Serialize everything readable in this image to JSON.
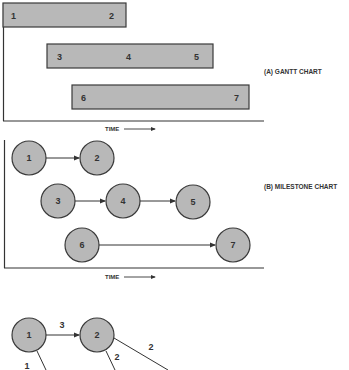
{
  "gantt": {
    "title": "(A) GANTT CHART",
    "time_label": "TIME",
    "bars": [
      {
        "x": 3,
        "y": 3,
        "w": 123,
        "h": 24,
        "labels": [
          {
            "text": "1",
            "x": 12
          },
          {
            "text": "2",
            "x": 112
          }
        ]
      },
      {
        "x": 47,
        "y": 44,
        "w": 166,
        "h": 24,
        "labels": [
          {
            "text": "3",
            "x": 59
          },
          {
            "text": "4",
            "x": 129
          },
          {
            "text": "5",
            "x": 197
          }
        ]
      },
      {
        "x": 72,
        "y": 85,
        "w": 177,
        "h": 24,
        "labels": [
          {
            "text": "6",
            "x": 83
          },
          {
            "text": "7",
            "x": 237
          }
        ]
      }
    ]
  },
  "milestone": {
    "title": "(B) MILESTONE CHART",
    "time_label": "TIME",
    "nodes": [
      {
        "id": "1",
        "cx": 29,
        "cy": 158
      },
      {
        "id": "2",
        "cx": 97,
        "cy": 158
      },
      {
        "id": "3",
        "cx": 58,
        "cy": 201
      },
      {
        "id": "4",
        "cx": 123,
        "cy": 201
      },
      {
        "id": "5",
        "cx": 193,
        "cy": 202
      },
      {
        "id": "6",
        "cx": 82,
        "cy": 245
      },
      {
        "id": "7",
        "cx": 233,
        "cy": 245
      }
    ],
    "edges": [
      [
        "1",
        "2"
      ],
      [
        "3",
        "4"
      ],
      [
        "4",
        "5"
      ],
      [
        "6",
        "7"
      ]
    ]
  },
  "network": {
    "nodes": [
      {
        "id": "1",
        "cx": 29,
        "cy": 335
      },
      {
        "id": "2",
        "cx": 97,
        "cy": 335
      }
    ],
    "edges": [
      {
        "from": "1",
        "to": "2",
        "label": "3"
      },
      {
        "from": "1",
        "to": "down",
        "label": "1"
      },
      {
        "from": "2",
        "to": "down",
        "label": "2"
      },
      {
        "from": "2",
        "to": "right-down",
        "label": "2"
      }
    ]
  },
  "colors": {
    "fill": "#b8b8b8",
    "stroke": "#3a3a3a"
  }
}
